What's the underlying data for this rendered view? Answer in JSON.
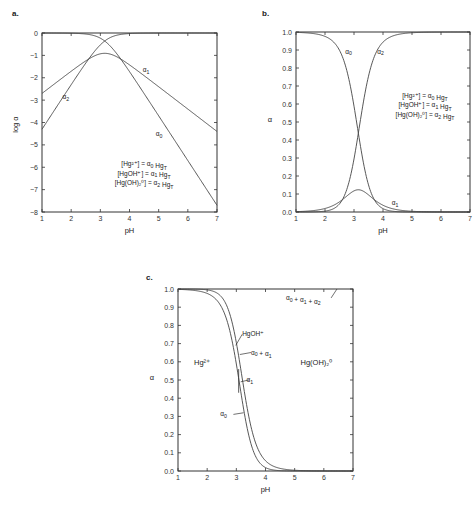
{
  "chart_data": [
    {
      "panel": "a.",
      "type": "line",
      "title": "",
      "xlabel": "pH",
      "ylabel": "log α",
      "xlim": [
        1,
        7
      ],
      "ylim": [
        -8,
        0
      ],
      "xticks": [
        1,
        2,
        3,
        4,
        5,
        6,
        7
      ],
      "yticks": [
        0,
        -1,
        -2,
        -3,
        -4,
        -5,
        -6,
        -7,
        -8
      ],
      "grid": false,
      "x": [
        1,
        1.5,
        2,
        2.5,
        3,
        3.5,
        4,
        4.5,
        5,
        5.5,
        6,
        6.5,
        7
      ],
      "series": [
        {
          "name": "α0",
          "values": [
            0.0,
            -0.01,
            -0.06,
            -0.19,
            -0.52,
            -1.06,
            -1.69,
            -2.49,
            -3.33,
            -4.28,
            -5.25,
            -6.23,
            -7.22
          ]
        },
        {
          "name": "α1",
          "values": [
            -2.7,
            -2.21,
            -1.76,
            -1.39,
            -1.02,
            -0.86,
            -0.89,
            -1.19,
            -1.63,
            -2.08,
            -2.55,
            -3.03,
            -3.62
          ]
        },
        {
          "name": "α2",
          "values": [
            -4.3,
            -3.31,
            -2.36,
            -1.49,
            -0.72,
            -0.26,
            -0.06,
            -0.01,
            0.0,
            0.0,
            0.0,
            0.0,
            0.0
          ]
        }
      ],
      "constants": {
        "pK1": 3.7,
        "pK2": 2.6
      },
      "curve_labels": [
        {
          "text": "α1",
          "x": 4.45,
          "y": -1.75
        },
        {
          "text": "α2",
          "x": 1.7,
          "y": -2.95
        },
        {
          "text": "α0",
          "x": 4.9,
          "y": -4.6
        }
      ],
      "legend": [
        "[Hg²⁺] = α0 HgT",
        "[HgOH⁺] = α1 HgT",
        "[Hg(OH)₂⁰] = α2 HgT"
      ]
    },
    {
      "panel": "b.",
      "type": "line",
      "title": "",
      "xlabel": "pH",
      "ylabel": "α",
      "xlim": [
        1,
        7
      ],
      "ylim": [
        0,
        1
      ],
      "xticks": [
        1,
        2,
        3,
        4,
        5,
        6,
        7
      ],
      "yticks": [
        0.0,
        0.1,
        0.2,
        0.3,
        0.4,
        0.5,
        0.6,
        0.7,
        0.8,
        0.9,
        1.0
      ],
      "grid": false,
      "x": [
        1,
        1.5,
        2,
        2.5,
        3,
        3.5,
        4,
        4.5,
        5,
        5.5,
        6,
        6.5,
        7
      ],
      "series": [
        {
          "name": "α0",
          "values": [
            0.998,
            0.987,
            0.923,
            0.689,
            0.301,
            0.087,
            0.02,
            0.004,
            0.001,
            0.0,
            0.0,
            0.0,
            0.0
          ]
        },
        {
          "name": "α1",
          "values": [
            0.002,
            0.006,
            0.018,
            0.043,
            0.096,
            0.137,
            0.118,
            0.06,
            0.023,
            0.008,
            0.003,
            0.001,
            0.0
          ]
        },
        {
          "name": "α2",
          "values": [
            0.0,
            0.0,
            0.004,
            0.034,
            0.189,
            0.548,
            0.87,
            0.975,
            0.994,
            0.998,
            0.999,
            1.0,
            1.0
          ]
        }
      ],
      "curve_labels": [
        {
          "text": "α0",
          "x": 2.7,
          "y": 0.88
        },
        {
          "text": "α2",
          "x": 3.8,
          "y": 0.88
        },
        {
          "text": "α1",
          "x": 4.3,
          "y": 0.04
        }
      ],
      "legend": [
        "[Hg²⁺] = α0 HgT",
        "[HgOH⁺] = α1 HgT",
        "[Hg(OH)₂⁰] = α2 HgT"
      ]
    },
    {
      "panel": "c.",
      "type": "area",
      "title": "",
      "xlabel": "pH",
      "ylabel": "α",
      "xlim": [
        1,
        7
      ],
      "ylim": [
        0,
        1
      ],
      "xticks": [
        1,
        2,
        3,
        4,
        5,
        6,
        7
      ],
      "yticks": [
        0.0,
        0.1,
        0.2,
        0.3,
        0.4,
        0.5,
        0.6,
        0.7,
        0.8,
        0.9,
        1.0
      ],
      "grid": false,
      "x": [
        1,
        1.5,
        2,
        2.5,
        3,
        3.5,
        4,
        4.5,
        5,
        5.5,
        6,
        6.5,
        7
      ],
      "series": [
        {
          "name": "α0",
          "values": [
            0.998,
            0.987,
            0.923,
            0.689,
            0.301,
            0.087,
            0.02,
            0.004,
            0.001,
            0.0,
            0.0,
            0.0,
            0.0
          ]
        },
        {
          "name": "α0 + α1",
          "values": [
            1.0,
            0.993,
            0.941,
            0.732,
            0.397,
            0.224,
            0.138,
            0.064,
            0.024,
            0.008,
            0.003,
            0.001,
            0.0
          ]
        },
        {
          "name": "α0 + α1 + α2",
          "values": [
            1,
            1,
            1,
            1,
            1,
            1,
            1,
            1,
            1,
            1,
            1,
            1,
            1
          ]
        }
      ],
      "region_labels": [
        {
          "text": "Hg²⁺",
          "x": 1.55,
          "y": 0.58
        },
        {
          "text": "Hg(OH)₂⁰",
          "x": 5.2,
          "y": 0.58
        }
      ],
      "annotations": [
        {
          "text": "HgOH⁺",
          "x": 3.2,
          "y": 0.74
        },
        {
          "text": "α0 + α1",
          "x": 3.5,
          "y": 0.64
        },
        {
          "text": "α1",
          "x": 3.35,
          "y": 0.49
        },
        {
          "text": "α0",
          "x": 2.45,
          "y": 0.3
        },
        {
          "text": "α0 + α1 + α2",
          "x": 4.7,
          "y": 0.94
        }
      ]
    }
  ]
}
